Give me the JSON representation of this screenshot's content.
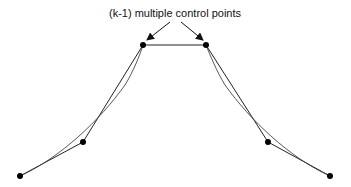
{
  "diagram": {
    "annotation": "(k-1) multiple control points",
    "colors": {
      "line": "#222222",
      "point": "#000000",
      "background": "#ffffff"
    },
    "control_points": [
      {
        "id": "p0",
        "x": 20,
        "y": 176
      },
      {
        "id": "p1",
        "x": 83,
        "y": 142
      },
      {
        "id": "p2",
        "x": 143,
        "y": 45
      },
      {
        "id": "p3",
        "x": 206,
        "y": 45
      },
      {
        "id": "p4",
        "x": 268,
        "y": 142
      },
      {
        "id": "p5",
        "x": 330,
        "y": 176
      }
    ]
  }
}
